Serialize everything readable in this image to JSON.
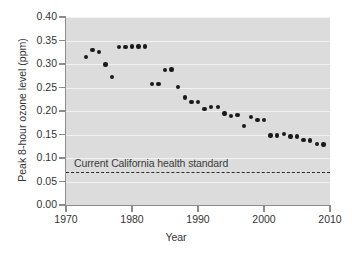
{
  "chart_data": {
    "type": "scatter",
    "title": "",
    "xlabel": "Year",
    "ylabel": "Peak 8-hour ozone level (ppm)",
    "xlim": [
      1970,
      2010
    ],
    "ylim": [
      0.0,
      0.4
    ],
    "grid": true,
    "legend": "none",
    "x_ticks": [
      1970,
      1980,
      1990,
      2000,
      2010
    ],
    "x_tick_labels": [
      "1970",
      "1980",
      "1990",
      "2000",
      "2010"
    ],
    "y_ticks": [
      0.0,
      0.05,
      0.1,
      0.15,
      0.2,
      0.25,
      0.3,
      0.35,
      0.4
    ],
    "y_tick_labels": [
      "0.00",
      "0.05",
      "0.10",
      "0.15",
      "0.20",
      "0.25",
      "0.30",
      "0.35",
      "0.40"
    ],
    "x": [
      1973,
      1974,
      1975,
      1976,
      1977,
      1978,
      1979,
      1980,
      1981,
      1982,
      1983,
      1984,
      1985,
      1986,
      1987,
      1988,
      1989,
      1990,
      1991,
      1992,
      1993,
      1994,
      1995,
      1996,
      1997,
      1998,
      1999,
      2000,
      2001,
      2002,
      2003,
      2004,
      2005,
      2006,
      2007,
      2008,
      2009
    ],
    "values": [
      0.315,
      0.33,
      0.326,
      0.299,
      0.273,
      0.336,
      0.336,
      0.337,
      0.337,
      0.337,
      0.257,
      0.257,
      0.287,
      0.288,
      0.251,
      0.229,
      0.219,
      0.219,
      0.204,
      0.208,
      0.208,
      0.195,
      0.19,
      0.192,
      0.168,
      0.187,
      0.181,
      0.181,
      0.148,
      0.148,
      0.151,
      0.146,
      0.146,
      0.138,
      0.137,
      0.13,
      0.129
    ],
    "series_name": "Peak 8-hour ozone level",
    "annotations": [
      {
        "name": "california-health-standard",
        "label": "Current California health standard",
        "value": 0.07,
        "style": "dashed-horizontal-line"
      }
    ],
    "colors": {
      "plot_background": "#dcdcdc",
      "point": "#1a1a1a",
      "gridline": "#f2f2f2",
      "axis": "#8c8c8c",
      "text": "#333333",
      "threshold_line": "#2b2b2b"
    }
  }
}
